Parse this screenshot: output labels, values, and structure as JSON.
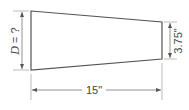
{
  "diagram": {
    "type": "tapered-bar-dimension-drawing",
    "shape": "trapezoid",
    "dimensions": {
      "left_height": {
        "label_var": "D",
        "label_eq": " = ?",
        "full": "D = ?"
      },
      "right_height": {
        "label": "3.75\""
      },
      "length": {
        "label": "15\""
      }
    },
    "colors": {
      "outline": "#555555",
      "dimension_line": "#777777",
      "extension_line": "#aaaaaa",
      "text": "#444444"
    }
  }
}
